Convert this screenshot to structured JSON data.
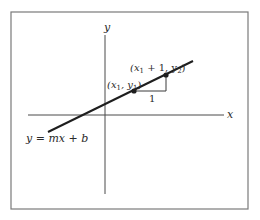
{
  "diagram": {
    "type": "coordinate-plane-line-slope",
    "frame": {
      "x": 11,
      "y": 12,
      "width": 237,
      "height": 197,
      "stroke": "#7a7a7a"
    },
    "axes": {
      "color": "#4a4a4a",
      "x_axis": {
        "label": "x",
        "y": 115,
        "x_start": 28,
        "x_end": 224
      },
      "y_axis": {
        "label": "y",
        "x": 105,
        "y_start": 35,
        "y_end": 194
      }
    },
    "line": {
      "label": "y = mx + b",
      "color": "#1e1e1e",
      "x1": 48,
      "y1": 132,
      "x2": 193,
      "y2": 61
    },
    "points": [
      {
        "id": "p1",
        "label_parts": [
          "(x",
          "1",
          ", y",
          "1",
          ")"
        ],
        "label": "(x1, y1)",
        "cx": 134,
        "cy": 91
      },
      {
        "id": "p2",
        "label_parts": [
          "(x",
          "1",
          " + 1, y",
          "2",
          ")"
        ],
        "label": "(x1 + 1, y2)",
        "cx": 166,
        "cy": 75
      }
    ],
    "slope_triangle": {
      "run_label": "1",
      "horizontal": {
        "x1": 134,
        "y1": 91,
        "x2": 166,
        "y2": 91
      },
      "vertical": {
        "x1": 166,
        "y1": 91,
        "x2": 166,
        "y2": 75
      }
    },
    "labels": {
      "x_axis": "x",
      "y_axis": "y",
      "equation": "y = mx + b",
      "run": "1",
      "p1": {
        "open": "(x",
        "sub1": "1",
        "mid": ", y",
        "sub2": "1",
        "close": ")"
      },
      "p2": {
        "open": "(x",
        "sub1": "1",
        "mid": " + 1, y",
        "sub2": "2",
        "close": ")"
      }
    }
  }
}
